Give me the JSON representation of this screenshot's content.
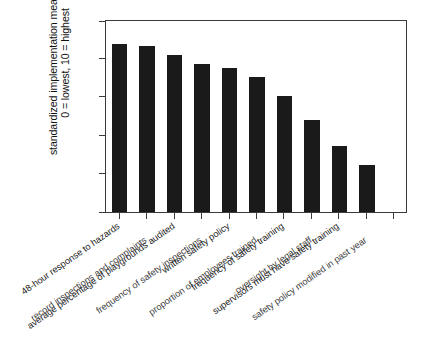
{
  "chart_data": {
    "type": "bar",
    "title": "",
    "subtitle": "",
    "xlabel": "",
    "ylabel": "standardized implementation measures, 0 = lowest, 10 = highest",
    "ylabel_lines": [
      "standardized implementation measures,",
      "0 = lowest, 10 = highest"
    ],
    "ylim": [
      0,
      10
    ],
    "yticks": [
      0,
      2,
      4,
      6,
      8,
      10
    ],
    "ytick_labels": [
      "0",
      "2",
      "4",
      "6",
      "8",
      "10"
    ],
    "grid": false,
    "legend": false,
    "bar_color": "#1a1a1a",
    "axis_color": "#3a3a3a",
    "categories": [
      "48-hour response to hazards",
      "record inspections and complaints",
      "average percentage of playgrounds audited",
      "frequency of safety inspections",
      "written safety policy",
      "proportion of employees trained",
      "frequency of safety training",
      "oversight by legal staff",
      "supervisors must have safety training",
      "safety policy modified in past year"
    ],
    "values": [
      8.7,
      8.6,
      8.15,
      7.65,
      7.45,
      7.0,
      6.0,
      4.75,
      3.4,
      2.45
    ],
    "n_bars": 11,
    "bars": [
      {
        "label": "48-hour response to hazards",
        "value": 8.7
      },
      {
        "label": "record inspections and complaints",
        "value": 8.6
      },
      {
        "label": "average percentage of playgrounds audited",
        "value": 8.15
      },
      {
        "label": "frequency of safety inspections",
        "value": 7.65
      },
      {
        "label": "written safety policy",
        "value": 7.45
      },
      {
        "label": "proportion of employees trained",
        "value": 7.0
      },
      {
        "label": "frequency of safety training",
        "value": 6.0
      },
      {
        "label": "oversight by legal staff",
        "value": 4.75
      },
      {
        "label": "supervisors must have safety training",
        "value": 3.4
      },
      {
        "label": "safety policy modified in past year",
        "value": 2.45
      }
    ]
  },
  "axis": {
    "y_title_line1": "standardized implementation measures,",
    "y_title_line2": "0 = lowest, 10 = highest",
    "tick_0": "0",
    "tick_2": "2",
    "tick_4": "4",
    "tick_6": "6",
    "tick_8": "8",
    "tick_10": "10"
  },
  "category_labels": {
    "c0": "48-hour response to hazards",
    "c1": "record inspections and complaints",
    "c2": "average percentage of playgrounds audited",
    "c3": "frequency of safety inspections",
    "c4": "written safety policy",
    "c5": "proportion of employees trained",
    "c6": "frequency of safety training",
    "c7": "oversight by legal staff",
    "c8": "supervisors must have safety training",
    "c9": "safety policy modified in past year"
  },
  "caption": {
    "partial_text": ""
  }
}
